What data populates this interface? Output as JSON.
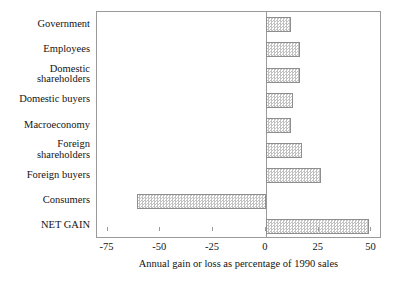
{
  "chart_data": {
    "type": "bar",
    "orientation": "horizontal",
    "title": "",
    "xlabel": "Annual gain or loss as percentage of 1990 sales",
    "ylabel": "",
    "xlim": [
      -80,
      55
    ],
    "xticks": [
      -75,
      -50,
      -25,
      0,
      25,
      50
    ],
    "xtick_labels": [
      "-75",
      "-50",
      "-25",
      "0",
      "25",
      "50"
    ],
    "grid": false,
    "legend": false,
    "categories": [
      "Government",
      "Employees",
      "Domestic\nshareholders",
      "Domestic buyers",
      "Macroeconomy",
      "Foreign\nshareholders",
      "Foreign buyers",
      "Consumers",
      "NET GAIN"
    ],
    "values": [
      12,
      16,
      16,
      13,
      12,
      17,
      26,
      -61,
      49
    ],
    "bar_fill": "#c2c2c2",
    "bar_edge": "#8e8e8e",
    "frame_color": "#9a9a9a"
  }
}
